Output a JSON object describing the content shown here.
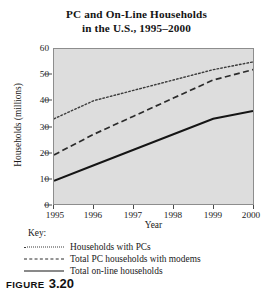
{
  "figure": {
    "title_line1": "PC and On-Line Households",
    "title_line2": "in the U.S., 1995–2000",
    "caption_word": "FIGURE",
    "caption_number": "3.20"
  },
  "key": {
    "heading": "Key:",
    "entries": [
      {
        "style": "dotted",
        "label": "Households with PCs"
      },
      {
        "style": "dashed",
        "label": "Total PC households with modems"
      },
      {
        "style": "solid",
        "label": "Total on-line households"
      }
    ]
  },
  "axes": {
    "ylabel": "Households (millions)",
    "xlabel": "Year",
    "yticks": [
      "0",
      "10",
      "20",
      "30",
      "40",
      "50",
      "60"
    ],
    "xticks": [
      "1995",
      "1996",
      "1997",
      "1998",
      "1999",
      "2000"
    ]
  },
  "colors": {
    "plot_background": "#dddddd",
    "plot_border": "#8d8d8d",
    "series_pcs": "#3a3a3a",
    "series_modems": "#2b2b2b",
    "series_online": "#151515",
    "text": "#1a1a1a"
  },
  "chart_data": {
    "type": "line",
    "title": "PC and On-Line Households in the U.S., 1995–2000",
    "xlabel": "Year",
    "ylabel": "Households (millions)",
    "x": [
      1995,
      1996,
      1997,
      1998,
      1999,
      2000
    ],
    "xlim": [
      1995,
      2000
    ],
    "ylim": [
      0,
      60
    ],
    "ytick_step": 10,
    "grid": false,
    "legend_position": "below-plot",
    "legend_title": "Key:",
    "series": [
      {
        "name": "Households with PCs",
        "line_style": "dotted",
        "values": [
          33,
          40,
          44,
          48,
          52,
          55
        ]
      },
      {
        "name": "Total PC households with modems",
        "line_style": "dashed",
        "values": [
          19,
          27,
          34,
          41,
          48,
          52
        ]
      },
      {
        "name": "Total on-line households",
        "line_style": "solid",
        "values": [
          9,
          15,
          21,
          27,
          33,
          36
        ]
      }
    ]
  }
}
